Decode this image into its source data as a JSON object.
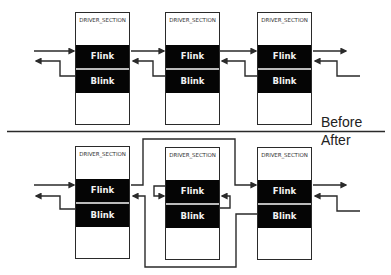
{
  "diagram": {
    "before": {
      "label": "Before",
      "nodes": [
        {
          "title": "DRIVER_SECTION",
          "flink": "Flink",
          "blink": "Blink"
        },
        {
          "title": "DRIVER_SECTION",
          "flink": "Flink",
          "blink": "Blink"
        },
        {
          "title": "DRIVER_SECTION",
          "flink": "Flink",
          "blink": "Blink"
        }
      ]
    },
    "after": {
      "label": "After",
      "nodes": [
        {
          "title": "DRIVER_SECTION",
          "flink": "Flink",
          "blink": "Blink"
        },
        {
          "title": "DRIVER_SECTION",
          "flink": "Flink",
          "blink": "Blink"
        },
        {
          "title": "DRIVER_SECTION",
          "flink": "Flink",
          "blink": "Blink"
        }
      ]
    },
    "colors": {
      "line": "#2a2a2a",
      "band": "#050505",
      "band_text": "#f2f2f2"
    }
  }
}
